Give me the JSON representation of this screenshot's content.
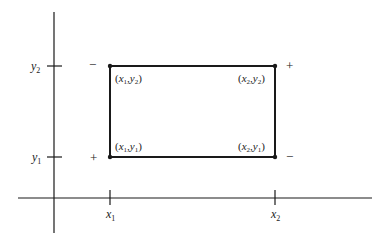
{
  "diagram": {
    "colors": {
      "stroke": "#1a1a1a",
      "background": "#ffffff"
    },
    "axes": {
      "x_ticks": [
        {
          "var": "x",
          "sub": "1"
        },
        {
          "var": "x",
          "sub": "2"
        }
      ],
      "y_ticks": [
        {
          "var": "y",
          "sub": "2"
        },
        {
          "var": "y",
          "sub": "1"
        }
      ]
    },
    "corners": {
      "top_left": {
        "open": "(",
        "x": "x",
        "xs": "1",
        "comma": ",",
        "y": "y",
        "ys": "2",
        "close": ")"
      },
      "top_right": {
        "open": "(",
        "x": "x",
        "xs": "2",
        "comma": ",",
        "y": "y",
        "ys": "2",
        "close": ")"
      },
      "bottom_left": {
        "open": "(",
        "x": "x",
        "xs": "1",
        "comma": ",",
        "y": "y",
        "ys": "1",
        "close": ")"
      },
      "bottom_right": {
        "open": "(",
        "x": "x",
        "xs": "2",
        "comma": ",",
        "y": "y",
        "ys": "1",
        "close": ")"
      }
    },
    "signs": {
      "top_left": "−",
      "top_right": "+",
      "bottom_left": "+",
      "bottom_right": "−"
    }
  }
}
